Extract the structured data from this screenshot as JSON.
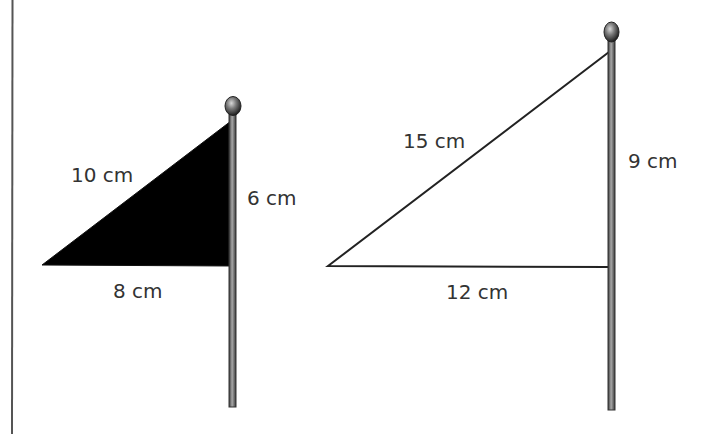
{
  "figure": {
    "flag_small": {
      "fill": "#000000",
      "hypotenuse_label": "10 cm",
      "vertical_label": "6 cm",
      "base_label": "8 cm"
    },
    "flag_large": {
      "fill": "#ffffff",
      "hypotenuse_label": "15 cm",
      "vertical_label": "9 cm",
      "base_label": "12 cm"
    }
  },
  "colors": {
    "line": "#222222",
    "pole": "#6e6e6e",
    "text": "#333333"
  }
}
